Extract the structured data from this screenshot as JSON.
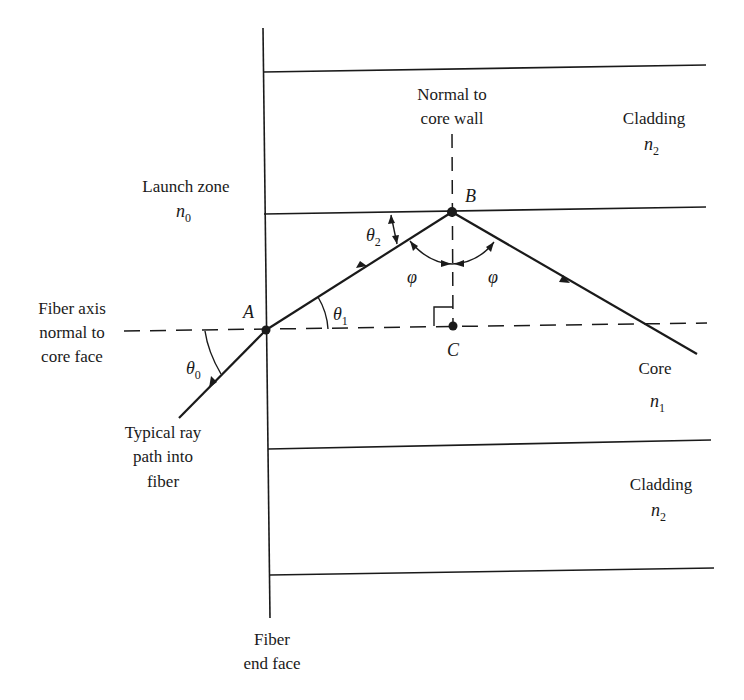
{
  "diagram": {
    "type": "optical-fiber-ray-path",
    "colors": {
      "line": "#1a1a1a",
      "background": "#ffffff"
    },
    "labels": {
      "normal_line1": "Normal to",
      "normal_line2": "core wall",
      "cladding_top": "Cladding",
      "cladding_top_index": "n",
      "cladding_top_index_sub": "2",
      "launch_zone": "Launch zone",
      "launch_index": "n",
      "launch_index_sub": "0",
      "fiber_axis_line1": "Fiber axis",
      "fiber_axis_line2": "normal to",
      "fiber_axis_line3": "core face",
      "core": "Core",
      "core_index": "n",
      "core_index_sub": "1",
      "ray_line1": "Typical ray",
      "ray_line2": "path into",
      "ray_line3": "fiber",
      "cladding_bottom": "Cladding",
      "cladding_bottom_index": "n",
      "cladding_bottom_index_sub": "2",
      "end_face_line1": "Fiber",
      "end_face_line2": "end face"
    },
    "points": {
      "A": {
        "label": "A",
        "x": 266,
        "y": 330
      },
      "B": {
        "label": "B",
        "x": 452,
        "y": 212
      },
      "C": {
        "label": "C",
        "x": 453,
        "y": 326
      }
    },
    "angles": {
      "theta0": {
        "symbol": "θ",
        "sub": "0"
      },
      "theta1": {
        "symbol": "θ",
        "sub": "1"
      },
      "theta2": {
        "symbol": "θ",
        "sub": "2"
      },
      "phi_left": {
        "symbol": "φ"
      },
      "phi_right": {
        "symbol": "φ"
      }
    }
  }
}
